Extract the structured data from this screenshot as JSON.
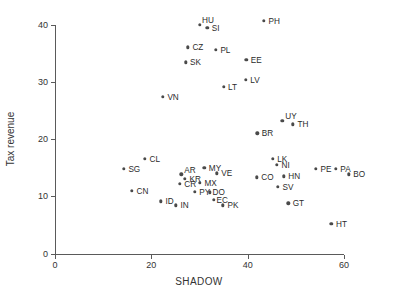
{
  "chart_data": {
    "type": "scatter",
    "title": "",
    "xlabel": "SHADOW",
    "ylabel": "Tax revenue",
    "xlim": [
      0,
      66
    ],
    "ylim": [
      0,
      42
    ],
    "xticks": [
      0,
      20,
      40,
      60
    ],
    "xticklabels": [
      "0",
      "20",
      "40",
      "60"
    ],
    "yticks": [
      0,
      10,
      20,
      30,
      40
    ],
    "yticklabels": [
      "0",
      "10",
      "20",
      "30",
      "40"
    ],
    "grid": false,
    "legend": null,
    "point_color": "#4a4a4a",
    "axis_color": "#5a5a5a",
    "points": [
      {
        "label": "HU",
        "x": 30.1,
        "y": 40.0,
        "lx": 2.0,
        "ly": -5.0
      },
      {
        "label": "SI",
        "x": 31.6,
        "y": 39.4,
        "lx": 4.5,
        "ly": 0.5
      },
      {
        "label": "PH",
        "x": 43.4,
        "y": 40.6,
        "lx": 4.5,
        "ly": 0.0
      },
      {
        "label": "CZ",
        "x": 27.6,
        "y": 36.0,
        "lx": 4.5,
        "ly": 0.0
      },
      {
        "label": "PL",
        "x": 33.4,
        "y": 35.6,
        "lx": 4.5,
        "ly": 0.0
      },
      {
        "label": "SK",
        "x": 27.1,
        "y": 33.4,
        "lx": 4.5,
        "ly": 0.0
      },
      {
        "label": "EE",
        "x": 39.7,
        "y": 33.8,
        "lx": 4.5,
        "ly": 0.0
      },
      {
        "label": "LT",
        "x": 35.0,
        "y": 29.1,
        "lx": 4.5,
        "ly": 0.0
      },
      {
        "label": "LV",
        "x": 39.6,
        "y": 30.3,
        "lx": 4.5,
        "ly": 0.0
      },
      {
        "label": "VN",
        "x": 22.4,
        "y": 27.4,
        "lx": 4.5,
        "ly": 0.0
      },
      {
        "label": "UY",
        "x": 47.2,
        "y": 23.2,
        "lx": 3.0,
        "ly": -4.8
      },
      {
        "label": "TH",
        "x": 49.4,
        "y": 22.6,
        "lx": 4.5,
        "ly": 0.2
      },
      {
        "label": "BR",
        "x": 42.0,
        "y": 21.0,
        "lx": 4.5,
        "ly": 0.0
      },
      {
        "label": "CL",
        "x": 18.7,
        "y": 16.5,
        "lx": 4.5,
        "ly": 0.0
      },
      {
        "label": "LK",
        "x": 45.2,
        "y": 16.5,
        "lx": 4.5,
        "ly": 0.0
      },
      {
        "label": "NI",
        "x": 46.1,
        "y": 15.5,
        "lx": 4.5,
        "ly": 0.0
      },
      {
        "label": "PE",
        "x": 54.2,
        "y": 14.8,
        "lx": 4.5,
        "ly": 0.0
      },
      {
        "label": "PA",
        "x": 58.3,
        "y": 14.8,
        "lx": 4.5,
        "ly": 0.0
      },
      {
        "label": "BO",
        "x": 61.0,
        "y": 13.8,
        "lx": 4.5,
        "ly": 0.0
      },
      {
        "label": "SG",
        "x": 14.3,
        "y": 14.8,
        "lx": 4.5,
        "ly": 0.0
      },
      {
        "label": "MY",
        "x": 31.0,
        "y": 15.0,
        "lx": 4.5,
        "ly": 0.0
      },
      {
        "label": "AR",
        "x": 26.2,
        "y": 13.8,
        "lx": 3.0,
        "ly": -4.4
      },
      {
        "label": "VE",
        "x": 33.6,
        "y": 14.0,
        "lx": 4.5,
        "ly": 0.0
      },
      {
        "label": "KR",
        "x": 27.0,
        "y": 13.0,
        "lx": 4.5,
        "ly": 0.0
      },
      {
        "label": "HN",
        "x": 47.5,
        "y": 13.5,
        "lx": 4.5,
        "ly": 0.0
      },
      {
        "label": "CO",
        "x": 41.9,
        "y": 13.3,
        "lx": 4.5,
        "ly": 0.0
      },
      {
        "label": "CR",
        "x": 25.9,
        "y": 12.2,
        "lx": 4.5,
        "ly": 0.0
      },
      {
        "label": "MX",
        "x": 30.1,
        "y": 12.3,
        "lx": 4.5,
        "ly": 0.0
      },
      {
        "label": "SV",
        "x": 46.3,
        "y": 11.6,
        "lx": 4.5,
        "ly": 0.0
      },
      {
        "label": "PY",
        "x": 29.0,
        "y": 10.8,
        "lx": 4.5,
        "ly": 0.0
      },
      {
        "label": "DO",
        "x": 32.1,
        "y": 10.7,
        "lx": 3.0,
        "ly": 0.0
      },
      {
        "label": "CN",
        "x": 16.0,
        "y": 10.9,
        "lx": 4.5,
        "ly": 0.0
      },
      {
        "label": "EC",
        "x": 33.0,
        "y": 9.4,
        "lx": 2.5,
        "ly": 0.0
      },
      {
        "label": "ID",
        "x": 22.0,
        "y": 9.1,
        "lx": 4.5,
        "ly": 0.0
      },
      {
        "label": "IN",
        "x": 25.1,
        "y": 8.4,
        "lx": 4.5,
        "ly": 0.0
      },
      {
        "label": "PK",
        "x": 34.9,
        "y": 8.4,
        "lx": 4.5,
        "ly": 0.0
      },
      {
        "label": "GT",
        "x": 48.4,
        "y": 8.8,
        "lx": 4.5,
        "ly": 0.0
      },
      {
        "label": "HT",
        "x": 57.4,
        "y": 5.2,
        "lx": 4.5,
        "ly": 0.0
      }
    ]
  }
}
